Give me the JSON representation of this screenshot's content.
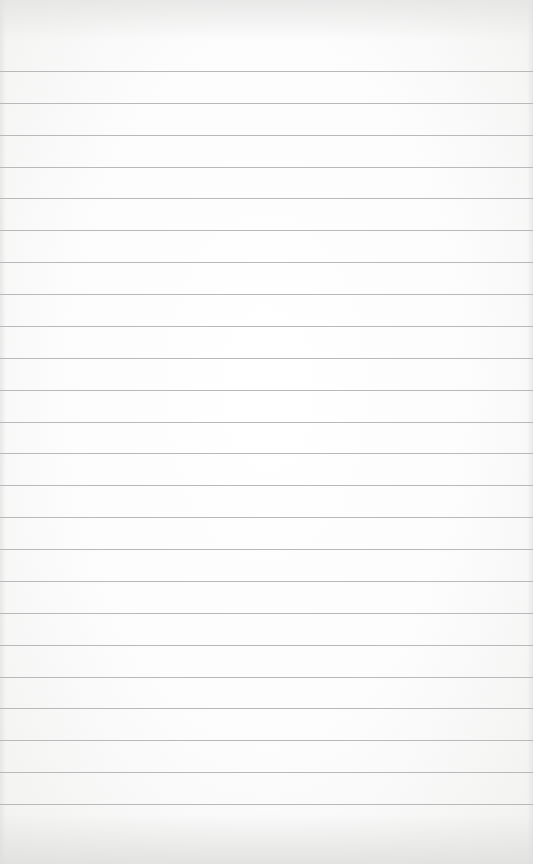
{
  "page": {
    "type": "lined-paper",
    "background_color": "#fcfcfc",
    "line_color": "#b9b9b9",
    "line_count": 24,
    "first_line_y": 71,
    "line_spacing": 31.87
  }
}
